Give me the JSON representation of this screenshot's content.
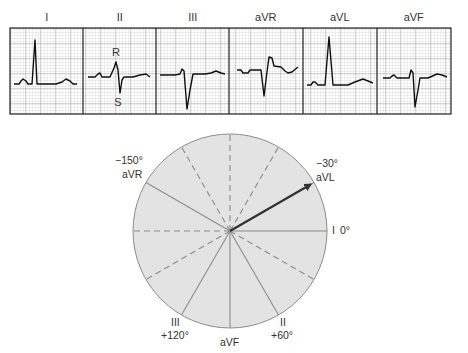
{
  "ecg_strip": {
    "leads": [
      {
        "label": "I",
        "x0": 10,
        "trace": "14,84 19,84 21,81 23,79 26,81 28,84 32,84 35,40 37,84 56,84 62,82 66,79 70,81 73,84 77,84"
      },
      {
        "label": "II",
        "x0": 83,
        "trace": "88,77 95,77 98,74 100,73 102,77 110,77 114,68 116,62 118,70 120,93 122,80 124,77 133,77 140,75 146,74 150,77"
      },
      {
        "label": "III",
        "x0": 156,
        "trace": "160,75 175,75 180,74 182,69 184,71 187,109 190,90 193,74 205,74 211,73 216,71 221,73 225,74"
      },
      {
        "label": "aVR",
        "x0": 229,
        "trace": "237,70 241,70 243,73 248,73 250,70 261,70 264,96 267,72 269,57 272,58 274,66 281,67 285,71 288,73 292,72 298,67"
      },
      {
        "label": "aVL",
        "x0": 303,
        "trace": "307,85 311,85 313,82 315,82 318,85 325,85 329,37 333,85 348,85 355,82 363,79 368,81 373,83"
      },
      {
        "label": "aVF",
        "x0": 377,
        "trace": "383,78 390,78 392,76 394,75 397,78 409,78 411,70 413,73 415,107 418,90 420,78 428,78 437,74 442,75 447,77"
      }
    ],
    "annotations": {
      "r_label": "R",
      "s_label": "S"
    },
    "grid": {
      "minor_px": 3,
      "major_px": 15,
      "minor_color": "#b9b9b9",
      "major_color": "#8e8e8e",
      "border_color": "#222222"
    }
  },
  "hexaxial_diagram": {
    "center": [
      230,
      231
    ],
    "radius": 97,
    "fill_color": "#e3e3e3",
    "line_color": "#8c8c8c",
    "arrow_color": "#333333",
    "solid_axes_deg": [
      0,
      60,
      90,
      120,
      -150,
      -30
    ],
    "dashed_axes_deg": [
      -90,
      -60,
      -120,
      30,
      150,
      180
    ],
    "arrow_angle_deg": -30,
    "labels": {
      "aVR_deg": "−150°",
      "aVR_name": "aVR",
      "aVL_deg": "−30°",
      "aVL_name": "aVL",
      "I_name": "I",
      "I_deg": "0°",
      "III_name": "III",
      "III_deg": "+120°",
      "aVF_name": "aVF",
      "II_name": "II",
      "II_deg": "+60°"
    }
  }
}
